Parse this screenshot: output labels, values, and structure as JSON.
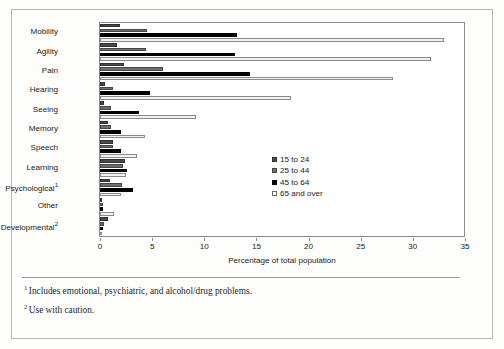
{
  "chart_data": {
    "type": "bar",
    "orientation": "horizontal",
    "title": "",
    "xlabel": "Percentage of total population",
    "ylabel": "",
    "xlim": [
      0,
      35
    ],
    "xticks": [
      0,
      5,
      10,
      15,
      20,
      25,
      30,
      35
    ],
    "grid": false,
    "legend_position": "center-right",
    "categories": [
      "Mobility",
      "Agility",
      "Pain",
      "Hearing",
      "Seeing",
      "Memory",
      "Speech",
      "Learning",
      "Psychological",
      "Other",
      "Developmental"
    ],
    "category_footnote_marks": [
      "",
      "",
      "",
      "",
      "",
      "",
      "",
      "",
      "1",
      "",
      "2"
    ],
    "series": [
      {
        "name": "15 to 24",
        "color": "#4a4a4a",
        "values": [
          1.9,
          1.6,
          2.3,
          0.5,
          0.4,
          0.8,
          1.2,
          2.4,
          1.0,
          0.2,
          0.8
        ]
      },
      {
        "name": "25 to 44",
        "color": "#6f6f6f",
        "values": [
          4.5,
          4.4,
          6.0,
          1.2,
          1.1,
          1.1,
          1.2,
          2.2,
          2.1,
          0.3,
          0.4
        ]
      },
      {
        "name": "45 to 64",
        "color": "#000000",
        "values": [
          13.1,
          12.9,
          14.4,
          4.8,
          3.7,
          2.0,
          2.0,
          2.6,
          3.2,
          0.3,
          0.3
        ]
      },
      {
        "name": "65 and over",
        "color": "#f2f2f2",
        "values": [
          33.0,
          31.7,
          28.1,
          18.3,
          9.2,
          4.3,
          3.5,
          2.5,
          2.0,
          1.3,
          0.2
        ]
      }
    ]
  },
  "footnotes": [
    {
      "mark": "1",
      "text": "Includes emotional, psychiatric, and alcohol/drug problems."
    },
    {
      "mark": "2",
      "text": "Use with caution."
    }
  ]
}
